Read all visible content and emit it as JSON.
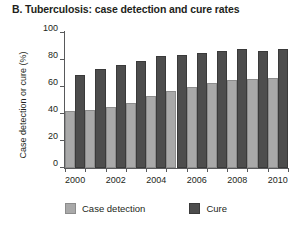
{
  "chart_data": {
    "type": "bar",
    "title": "B. Tuberculosis: case detection and cure rates",
    "xlabel": "",
    "ylabel": "Case detection or cure (%)",
    "ylim": [
      0,
      100
    ],
    "yticks": [
      0,
      20,
      40,
      60,
      80,
      100
    ],
    "grid": false,
    "legend_position": "bottom-left",
    "categories": [
      "2000",
      "2001",
      "2002",
      "2003",
      "2004",
      "2005",
      "2006",
      "2007",
      "2008",
      "2009",
      "2010"
    ],
    "xtick_labels": [
      "2000",
      "2002",
      "2004",
      "2006",
      "2008",
      "2010"
    ],
    "series": [
      {
        "name": "Case detection",
        "color": "#a9a9a9",
        "values": [
          42,
          43,
          45,
          48,
          53,
          57,
          60,
          63,
          65,
          66,
          67
        ]
      },
      {
        "name": "Cure",
        "color": "#4d4d4d",
        "values": [
          69,
          73,
          76,
          79,
          83,
          84,
          85,
          87,
          88,
          87,
          88
        ]
      }
    ]
  },
  "axis": {
    "line_color": "#58595b"
  }
}
